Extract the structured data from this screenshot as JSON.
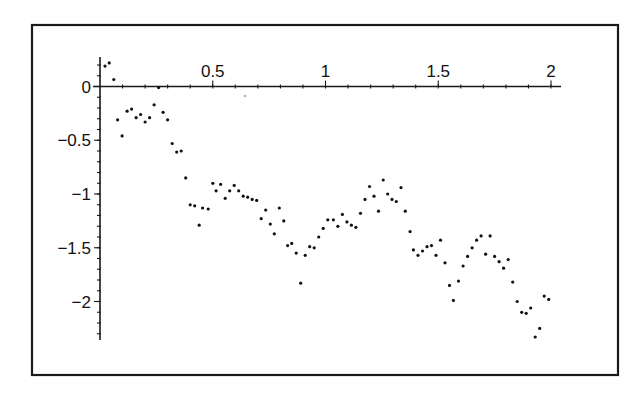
{
  "chart_data": {
    "type": "scatter",
    "title": "",
    "xlabel": "",
    "ylabel": "",
    "xlim": [
      0,
      2.05
    ],
    "ylim": [
      -2.35,
      0.27
    ],
    "grid": false,
    "legend": null,
    "x_ticks": [
      {
        "value": 0.5,
        "label": "0.5"
      },
      {
        "value": 1,
        "label": "1"
      },
      {
        "value": 1.5,
        "label": "1.5"
      },
      {
        "value": 2,
        "label": "2"
      }
    ],
    "y_ticks": [
      {
        "value": 0,
        "label": "0"
      },
      {
        "value": -0.5,
        "label": "−0.5"
      },
      {
        "value": -1,
        "label": "−1"
      },
      {
        "value": -1.5,
        "label": "−1.5"
      },
      {
        "value": -2,
        "label": "−2"
      }
    ],
    "minor_tick_step": 0.1,
    "series": [
      {
        "name": "sample path",
        "color": "#111111",
        "marker": "dot",
        "points": [
          [
            0.022,
            0.19
          ],
          [
            0.041,
            0.22
          ],
          [
            0.061,
            0.065
          ],
          [
            0.078,
            -0.31
          ],
          [
            0.098,
            -0.46
          ],
          [
            0.12,
            -0.23
          ],
          [
            0.14,
            -0.21
          ],
          [
            0.16,
            -0.29
          ],
          [
            0.18,
            -0.26
          ],
          [
            0.2,
            -0.33
          ],
          [
            0.22,
            -0.29
          ],
          [
            0.24,
            -0.17
          ],
          [
            0.26,
            -0.01
          ],
          [
            0.28,
            -0.24
          ],
          [
            0.3,
            -0.31
          ],
          [
            0.32,
            -0.53
          ],
          [
            0.34,
            -0.61
          ],
          [
            0.36,
            -0.6
          ],
          [
            0.38,
            -0.85
          ],
          [
            0.4,
            -1.1
          ],
          [
            0.42,
            -1.11
          ],
          [
            0.44,
            -1.29
          ],
          [
            0.455,
            -1.13
          ],
          [
            0.48,
            -1.14
          ],
          [
            0.5,
            -0.9
          ],
          [
            0.515,
            -0.97
          ],
          [
            0.535,
            -0.91
          ],
          [
            0.555,
            -1.04
          ],
          [
            0.575,
            -0.97
          ],
          [
            0.595,
            -0.92
          ],
          [
            0.615,
            -0.97
          ],
          [
            0.635,
            -1.02
          ],
          [
            0.655,
            -1.03
          ],
          [
            0.675,
            -1.05
          ],
          [
            0.695,
            -1.06
          ],
          [
            0.715,
            -1.23
          ],
          [
            0.735,
            -1.15
          ],
          [
            0.755,
            -1.28
          ],
          [
            0.773,
            -1.37
          ],
          [
            0.795,
            -1.13
          ],
          [
            0.815,
            -1.25
          ],
          [
            0.832,
            -1.48
          ],
          [
            0.85,
            -1.46
          ],
          [
            0.87,
            -1.55
          ],
          [
            0.89,
            -1.83
          ],
          [
            0.91,
            -1.57
          ],
          [
            0.93,
            -1.49
          ],
          [
            0.95,
            -1.5
          ],
          [
            0.97,
            -1.4
          ],
          [
            0.99,
            -1.32
          ],
          [
            1.01,
            -1.24
          ],
          [
            1.035,
            -1.24
          ],
          [
            1.055,
            -1.3
          ],
          [
            1.075,
            -1.19
          ],
          [
            1.095,
            -1.26
          ],
          [
            1.115,
            -1.29
          ],
          [
            1.135,
            -1.31
          ],
          [
            1.155,
            -1.18
          ],
          [
            1.175,
            -1.05
          ],
          [
            1.195,
            -0.93
          ],
          [
            1.215,
            -1.02
          ],
          [
            1.235,
            -1.16
          ],
          [
            1.256,
            -0.87
          ],
          [
            1.276,
            -1.0
          ],
          [
            1.295,
            -1.05
          ],
          [
            1.314,
            -1.07
          ],
          [
            1.335,
            -0.94
          ],
          [
            1.354,
            -1.16
          ],
          [
            1.375,
            -1.35
          ],
          [
            1.39,
            -1.52
          ],
          [
            1.41,
            -1.57
          ],
          [
            1.43,
            -1.53
          ],
          [
            1.45,
            -1.49
          ],
          [
            1.47,
            -1.48
          ],
          [
            1.49,
            -1.57
          ],
          [
            1.51,
            -1.43
          ],
          [
            1.53,
            -1.64
          ],
          [
            1.55,
            -1.85
          ],
          [
            1.567,
            -1.99
          ],
          [
            1.59,
            -1.81
          ],
          [
            1.61,
            -1.67
          ],
          [
            1.63,
            -1.58
          ],
          [
            1.65,
            -1.5
          ],
          [
            1.67,
            -1.43
          ],
          [
            1.69,
            -1.39
          ],
          [
            1.71,
            -1.56
          ],
          [
            1.73,
            -1.39
          ],
          [
            1.75,
            -1.58
          ],
          [
            1.77,
            -1.63
          ],
          [
            1.79,
            -1.69
          ],
          [
            1.81,
            -1.61
          ],
          [
            1.83,
            -1.82
          ],
          [
            1.85,
            -2.0
          ],
          [
            1.87,
            -2.1
          ],
          [
            1.89,
            -2.11
          ],
          [
            1.91,
            -2.06
          ],
          [
            1.93,
            -2.33
          ],
          [
            1.95,
            -2.25
          ],
          [
            1.97,
            -1.95
          ],
          [
            1.99,
            -1.98
          ]
        ]
      }
    ]
  },
  "layout": {
    "frame": {
      "left": 32,
      "top": 25,
      "right": 618,
      "bottom": 375
    },
    "origin_px": {
      "x": 100,
      "y": 86.5
    },
    "px_per_unit": {
      "x": 225.5,
      "y": 107.5
    },
    "x_axis_px": {
      "from": 93,
      "to": 561
    },
    "y_axis_px": {
      "top": 57,
      "bottom": 340
    }
  }
}
